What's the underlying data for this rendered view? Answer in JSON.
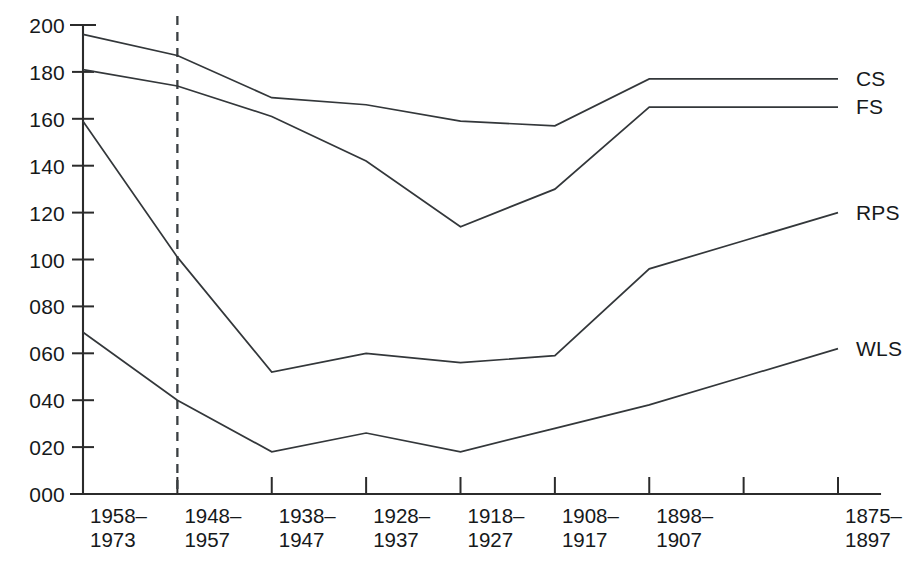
{
  "chart_data": {
    "type": "line",
    "title": "",
    "xlabel": "",
    "ylabel": "",
    "ylim": [
      0,
      200
    ],
    "ytick_labels": [
      "200",
      "180",
      "160",
      "140",
      "120",
      "100",
      "080",
      "060",
      "040",
      "020",
      "000"
    ],
    "ytick_values": [
      200,
      180,
      160,
      140,
      120,
      100,
      80,
      60,
      40,
      20,
      0
    ],
    "grid": false,
    "legend_position": "right-inline",
    "categories": [
      "1958–1973",
      "1948–1957",
      "1938–1947",
      "1928–1937",
      "1918–1927",
      "1908–1917",
      "1898–1907",
      "",
      "1875–1897"
    ],
    "category_lines": [
      [
        "1958–",
        "1973"
      ],
      [
        "1948–",
        "1957"
      ],
      [
        "1938–",
        "1947"
      ],
      [
        "1928–",
        "1937"
      ],
      [
        "1918–",
        "1927"
      ],
      [
        "1908–",
        "1917"
      ],
      [
        "1898–",
        "1907"
      ],
      [
        "",
        ""
      ],
      [
        "1875–",
        "1897"
      ]
    ],
    "series": [
      {
        "name": "CS",
        "label": "CS",
        "values": [
          196,
          187,
          169,
          166,
          159,
          157,
          177,
          177,
          177
        ]
      },
      {
        "name": "FS",
        "label": "FS",
        "values": [
          181,
          174,
          161,
          142,
          114,
          130,
          165,
          165,
          165
        ]
      },
      {
        "name": "RPS",
        "label": "RPS",
        "values": [
          159,
          101,
          52,
          60,
          56,
          59,
          96,
          108,
          120
        ]
      },
      {
        "name": "WLS",
        "label": "WLS",
        "values": [
          69,
          40,
          18,
          26,
          18,
          28,
          38,
          50,
          62
        ]
      }
    ],
    "annotations": [
      {
        "type": "vertical-dashed-line",
        "at_category": "1948–1957",
        "label": ""
      }
    ]
  }
}
